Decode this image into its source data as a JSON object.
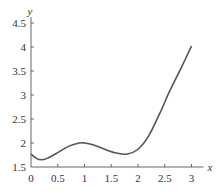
{
  "chart_data": {
    "type": "line",
    "title": "",
    "xlabel": "x",
    "ylabel": "y",
    "xlim": [
      0,
      3
    ],
    "ylim": [
      1.5,
      4.5
    ],
    "grid": false,
    "x_ticks": [
      "0",
      "0.5",
      "1",
      "1.5",
      "2",
      "2.5",
      "3"
    ],
    "y_ticks": [
      "1.5",
      "2",
      "2.5",
      "3",
      "3.5",
      "4",
      "4.5"
    ],
    "series": [
      {
        "name": "f(x)",
        "color": "#555555",
        "x": [
          0,
          0.1,
          0.2,
          0.3,
          0.5,
          0.7,
          0.9,
          1.0,
          1.2,
          1.4,
          1.6,
          1.8,
          2.0,
          2.2,
          2.4,
          2.6,
          2.8,
          3.0
        ],
        "y": [
          1.77,
          1.68,
          1.65,
          1.68,
          1.8,
          1.93,
          2.0,
          2.0,
          1.95,
          1.86,
          1.79,
          1.77,
          1.87,
          2.15,
          2.6,
          3.1,
          3.55,
          4.02
        ]
      }
    ]
  }
}
